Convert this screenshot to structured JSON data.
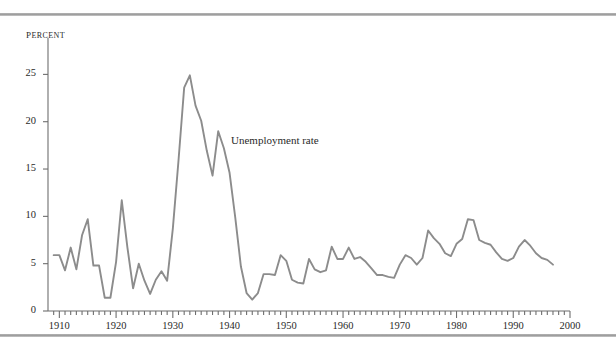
{
  "figure": {
    "background_color": "#ffffff",
    "rule_color": "#9a9a9a",
    "axis_color": "#6e6e6e",
    "line_color": "#8c8c8c",
    "text_color": "#2a2a2a"
  },
  "chart_data": {
    "type": "line",
    "title": "",
    "xlabel": "",
    "ylabel": "Percent",
    "xlim": [
      1908,
      2000
    ],
    "ylim": [
      0,
      28
    ],
    "yticks": [
      0,
      5,
      10,
      15,
      20,
      25
    ],
    "ytick_labels": [
      "0",
      "5",
      "10",
      "15",
      "20",
      "25"
    ],
    "xticks": [
      1910,
      1920,
      1930,
      1940,
      1950,
      1960,
      1970,
      1980,
      1990,
      2000
    ],
    "xtick_labels": [
      "1910",
      "1920",
      "1930",
      "1940",
      "1950",
      "1960",
      "1970",
      "1980",
      "1990",
      "2000"
    ],
    "minor_tick_interval": 1,
    "grid": false,
    "legend": "none",
    "annotations": [
      {
        "text": "Unemployment rate",
        "x": 1938,
        "y": 17.5
      }
    ],
    "series": [
      {
        "name": "Unemployment rate",
        "color": "#8c8c8c",
        "x": [
          1909,
          1910,
          1911,
          1912,
          1913,
          1914,
          1915,
          1916,
          1917,
          1918,
          1919,
          1920,
          1921,
          1922,
          1923,
          1924,
          1925,
          1926,
          1927,
          1928,
          1929,
          1930,
          1931,
          1932,
          1933,
          1934,
          1935,
          1936,
          1937,
          1938,
          1939,
          1940,
          1941,
          1942,
          1943,
          1944,
          1945,
          1946,
          1947,
          1948,
          1949,
          1950,
          1951,
          1952,
          1953,
          1954,
          1955,
          1956,
          1957,
          1958,
          1959,
          1960,
          1961,
          1962,
          1963,
          1964,
          1965,
          1966,
          1967,
          1968,
          1969,
          1970,
          1971,
          1972,
          1973,
          1974,
          1975,
          1976,
          1977,
          1978,
          1979,
          1980,
          1981,
          1982,
          1983,
          1984,
          1985,
          1986,
          1987,
          1988,
          1989,
          1990,
          1991,
          1992,
          1993,
          1994,
          1995,
          1996,
          1997
        ],
        "values": [
          5.9,
          5.9,
          4.3,
          6.7,
          4.4,
          8.0,
          9.7,
          4.8,
          4.8,
          1.4,
          1.4,
          5.2,
          11.7,
          6.7,
          2.4,
          5.0,
          3.2,
          1.8,
          3.3,
          4.2,
          3.2,
          8.7,
          15.9,
          23.6,
          24.9,
          21.7,
          20.1,
          16.9,
          14.3,
          19.0,
          17.2,
          14.6,
          9.9,
          4.7,
          1.9,
          1.2,
          1.9,
          3.9,
          3.9,
          3.8,
          5.9,
          5.3,
          3.3,
          3.0,
          2.9,
          5.5,
          4.4,
          4.1,
          4.3,
          6.8,
          5.5,
          5.5,
          6.7,
          5.5,
          5.7,
          5.2,
          4.5,
          3.8,
          3.8,
          3.6,
          3.5,
          4.9,
          5.9,
          5.6,
          4.9,
          5.6,
          8.5,
          7.7,
          7.1,
          6.1,
          5.8,
          7.1,
          7.6,
          9.7,
          9.6,
          7.5,
          7.2,
          7.0,
          6.2,
          5.5,
          5.3,
          5.6,
          6.8,
          7.5,
          6.9,
          6.1,
          5.6,
          5.4,
          4.9
        ]
      }
    ]
  }
}
